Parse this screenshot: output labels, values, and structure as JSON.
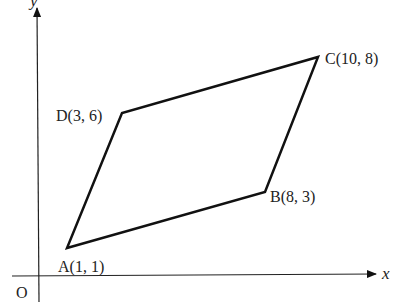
{
  "diagram": {
    "type": "coordinate-geometry",
    "shape": "parallelogram ABCD",
    "axes": {
      "x_label": "x",
      "y_label": "y",
      "origin_label": "O"
    },
    "vertices": [
      {
        "name": "A",
        "label": "A(1, 1)",
        "x": 1,
        "y": 1
      },
      {
        "name": "B",
        "label": "B(8, 3)",
        "x": 8,
        "y": 3
      },
      {
        "name": "C",
        "label": "C(10, 8)",
        "x": 10,
        "y": 8
      },
      {
        "name": "D",
        "label": "D(3, 6)",
        "x": 3,
        "y": 6
      }
    ],
    "edges": [
      "AB",
      "BC",
      "CD",
      "DA"
    ],
    "colors": {
      "stroke": "#111111",
      "text": "#222222",
      "background": "#ffffff"
    }
  }
}
